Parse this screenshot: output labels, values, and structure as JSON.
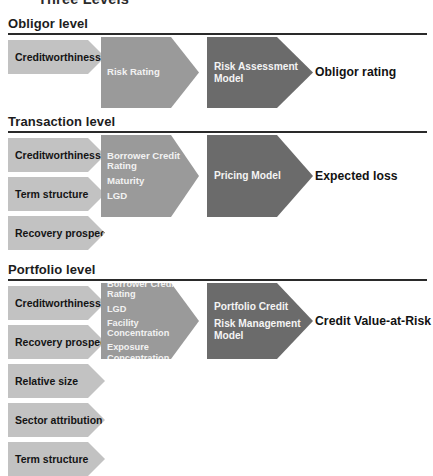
{
  "page": {
    "title": "Three Levels"
  },
  "sections": [
    {
      "id": "obligor",
      "header": "Obligor level",
      "inputs": [
        {
          "label": "Creditworthiness"
        }
      ],
      "factors": [
        {
          "label": "Risk Rating"
        }
      ],
      "model": {
        "lines": [
          "Risk Rating"
        ],
        "name": "Risk Rating"
      },
      "engine": {
        "lines": [
          "Risk Assessment",
          "Model"
        ]
      },
      "output": "Obligor rating"
    },
    {
      "id": "transaction",
      "header": "Transaction level",
      "inputs": [
        {
          "label": "Creditworthiness"
        },
        {
          "label": "Term structure"
        },
        {
          "label": "Recovery prospects"
        }
      ],
      "factors": [
        {
          "label": "Borrower Credit Rating"
        },
        {
          "label": "Maturity"
        },
        {
          "label": "LGD"
        }
      ],
      "engine": {
        "lines": [
          "Pricing Model"
        ]
      },
      "output": "Expected loss"
    },
    {
      "id": "portfolio",
      "header": "Portfolio level",
      "inputs": [
        {
          "label": "Creditworthiness"
        },
        {
          "label": "Recovery prospects"
        },
        {
          "label": "Relative size"
        },
        {
          "label": "Sector attribution"
        },
        {
          "label": "Term structure"
        }
      ],
      "factors": [
        {
          "label": "Borrower Credit Rating"
        },
        {
          "label": "LGD"
        },
        {
          "label": "Facility Concentration"
        },
        {
          "label": "Exposure Concentration"
        }
      ],
      "engine": {
        "lines": [
          "Portfolio Credit",
          "Risk Management Model"
        ]
      },
      "output": "Credit Value-at-Risk"
    }
  ],
  "colors": {
    "input_fill": "#c2c2c2",
    "factor_fill": "#9a9a9a",
    "model_fill": "#6b6b6b",
    "arrowhead_fill": "#0b0b0b",
    "rule": "#2a2a2a",
    "text_dark": "#141414",
    "text_light": "#f2f2f2"
  }
}
